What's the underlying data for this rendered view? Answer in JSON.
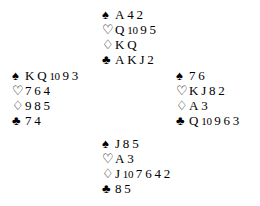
{
  "diagram": {
    "type": "bridge-hand-diagram",
    "layout": "compass",
    "background_color": "#ffffff",
    "text_color": "#000000"
  },
  "suits": [
    {
      "key": "spades",
      "name": "spade-suit-symbol",
      "glyph": "♠",
      "fill": "solid"
    },
    {
      "key": "hearts",
      "name": "heart-suit-symbol",
      "glyph": "♡",
      "fill": "outline"
    },
    {
      "key": "diamonds",
      "name": "diamond-suit-symbol",
      "glyph": "♢",
      "fill": "outline"
    },
    {
      "key": "clubs",
      "name": "club-suit-symbol",
      "glyph": "♣",
      "fill": "solid"
    }
  ],
  "hands": {
    "north": {
      "position": "north",
      "spades": [
        "A",
        "4",
        "2"
      ],
      "hearts": [
        "Q",
        "10",
        "9",
        "5"
      ],
      "diamonds": [
        "K",
        "Q"
      ],
      "clubs": [
        "A",
        "K",
        "J",
        "2"
      ]
    },
    "west": {
      "position": "west",
      "spades": [
        "K",
        "Q",
        "10",
        "9",
        "3"
      ],
      "hearts": [
        "7",
        "6",
        "4"
      ],
      "diamonds": [
        "9",
        "8",
        "5"
      ],
      "clubs": [
        "7",
        "4"
      ]
    },
    "east": {
      "position": "east",
      "spades": [
        "7",
        "6"
      ],
      "hearts": [
        "K",
        "J",
        "8",
        "2"
      ],
      "diamonds": [
        "A",
        "3"
      ],
      "clubs": [
        "Q",
        "10",
        "9",
        "6",
        "3"
      ]
    },
    "south": {
      "position": "south",
      "spades": [
        "J",
        "8",
        "5"
      ],
      "hearts": [
        "A",
        "3"
      ],
      "diamonds": [
        "J",
        "10",
        "7",
        "6",
        "4",
        "2"
      ],
      "clubs": [
        "8",
        "5"
      ]
    }
  }
}
